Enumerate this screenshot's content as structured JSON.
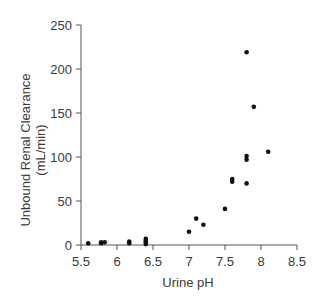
{
  "chart_data": {
    "type": "scatter",
    "title": "",
    "xlabel": "Urine pH",
    "ylabel_lines": [
      "Unbound Renal Clearance",
      "(mL/min)"
    ],
    "ylabel": "Unbound Renal Clearance (mL/min)",
    "xlim": [
      5.5,
      8.5
    ],
    "ylim": [
      0,
      250
    ],
    "xticks": [
      "5.5",
      "6",
      "6.5",
      "7",
      "7.5",
      "8",
      "8.5"
    ],
    "yticks": [
      "0",
      "50",
      "100",
      "150",
      "200",
      "250"
    ],
    "grid": false,
    "legend": null,
    "marker_color": "#111111",
    "axis_color": "#555555",
    "points": [
      {
        "x": 5.6,
        "y": 2
      },
      {
        "x": 5.78,
        "y": 2
      },
      {
        "x": 5.78,
        "y": 3
      },
      {
        "x": 5.83,
        "y": 3
      },
      {
        "x": 6.17,
        "y": 2
      },
      {
        "x": 6.17,
        "y": 4
      },
      {
        "x": 6.4,
        "y": 1
      },
      {
        "x": 6.4,
        "y": 3
      },
      {
        "x": 6.4,
        "y": 5
      },
      {
        "x": 6.4,
        "y": 7
      },
      {
        "x": 7.0,
        "y": 15
      },
      {
        "x": 7.1,
        "y": 30
      },
      {
        "x": 7.2,
        "y": 23
      },
      {
        "x": 7.5,
        "y": 41
      },
      {
        "x": 7.6,
        "y": 72
      },
      {
        "x": 7.6,
        "y": 75
      },
      {
        "x": 7.8,
        "y": 70
      },
      {
        "x": 7.8,
        "y": 97
      },
      {
        "x": 7.8,
        "y": 101
      },
      {
        "x": 7.8,
        "y": 219
      },
      {
        "x": 7.9,
        "y": 157
      },
      {
        "x": 8.1,
        "y": 106
      }
    ]
  }
}
